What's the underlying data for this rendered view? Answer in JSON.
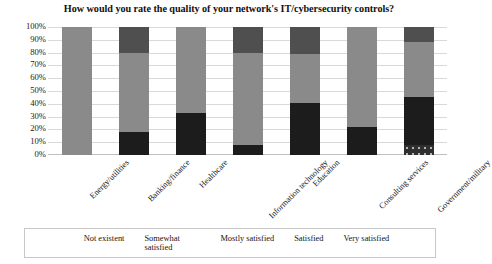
{
  "chart_data": {
    "type": "bar",
    "subtype": "stacked-100-percent-column",
    "title": "How would you rate the quality of your network's IT/cybersecurity controls?",
    "xlabel": "",
    "ylabel": "",
    "ylim": [
      0,
      100
    ],
    "ytick_labels": [
      "100%",
      "90%",
      "80%",
      "70%",
      "60%",
      "50%",
      "40%",
      "30%",
      "20%",
      "10%",
      "0%"
    ],
    "ytick_values": [
      100,
      90,
      80,
      70,
      60,
      50,
      40,
      30,
      20,
      10,
      0
    ],
    "grid": true,
    "legend_position": "bottom",
    "categories": [
      "Energy/utilities",
      "Banking/finance",
      "Healthcare",
      "Information technology",
      "Education",
      "Consulting services",
      "Government/military"
    ],
    "stack_order_bottom_to_top": [
      "Not existent",
      "Somewhat satisfied",
      "Mostly satisfied",
      "Satisfied",
      "Very satisfied"
    ],
    "series": [
      {
        "name": "Not existent",
        "color": "#2f2f2f",
        "pattern": "dark-with-light-dots",
        "values": [
          0,
          0,
          0,
          0,
          0,
          0,
          8
        ]
      },
      {
        "name": "Somewhat satisfied",
        "color": "#1c1c1c",
        "pattern": "black-white-checker-dots",
        "values": [
          0,
          18,
          33,
          8,
          41,
          22,
          37
        ]
      },
      {
        "name": "Mostly satisfied",
        "color": "#d5d5d5",
        "pattern": "solid",
        "values": [
          0,
          0,
          0,
          0,
          0,
          0,
          0
        ]
      },
      {
        "name": "Satisfied",
        "color": "#8a8a8a",
        "pattern": "solid",
        "values": [
          100,
          62,
          67,
          72,
          38,
          78,
          43
        ]
      },
      {
        "name": "Very satisfied",
        "color": "#4f4f4f",
        "pattern": "solid",
        "values": [
          0,
          20,
          0,
          20,
          21,
          0,
          12
        ]
      }
    ]
  },
  "legend": {
    "items": [
      {
        "label": "Not existent",
        "series": "Not existent"
      },
      {
        "label": "Somewhat satisfied",
        "series": "Somewhat satisfied"
      },
      {
        "label": "Mostly satisfied",
        "series": "Mostly satisfied"
      },
      {
        "label": "Satisfied",
        "series": "Satisfied"
      },
      {
        "label": "Very satisfied",
        "series": "Very satisfied"
      }
    ]
  }
}
